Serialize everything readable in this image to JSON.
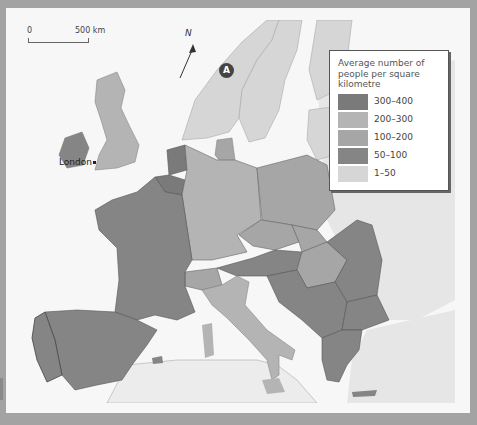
{
  "figure": {
    "type": "choropleth map",
    "region": "Western and Central Europe",
    "background": "#a3a3a3",
    "sea_color": "#f7f7f7",
    "non_data_land_color": "#e9e9e9"
  },
  "scale_bar": {
    "start_label": "0",
    "end_label": "500 km"
  },
  "north_arrow": {
    "label": "N"
  },
  "markers": [
    {
      "label": "A",
      "location": "Norway"
    }
  ],
  "cities": [
    {
      "name": "London"
    }
  ],
  "legend": {
    "title": "Average number of people per square kilometre",
    "classes": [
      {
        "label": "300–400",
        "color": "#7a7a7a"
      },
      {
        "label": "200–300",
        "color": "#b4b4b4"
      },
      {
        "label": "100–200",
        "color": "#a6a6a6"
      },
      {
        "label": "50–100",
        "color": "#858585"
      },
      {
        "label": "1–50",
        "color": "#d6d6d6"
      }
    ]
  },
  "countries": [
    {
      "name": "Netherlands",
      "class": "300–400"
    },
    {
      "name": "Belgium",
      "class": "300–400"
    },
    {
      "name": "United Kingdom",
      "class": "200–300"
    },
    {
      "name": "Germany",
      "class": "200–300"
    },
    {
      "name": "Italy",
      "class": "200–300"
    },
    {
      "name": "Luxembourg",
      "class": "100–200"
    },
    {
      "name": "Switzerland",
      "class": "100–200"
    },
    {
      "name": "Poland",
      "class": "100–200"
    },
    {
      "name": "Czech Republic",
      "class": "100–200"
    },
    {
      "name": "Hungary",
      "class": "100–200"
    },
    {
      "name": "Denmark",
      "class": "100–200"
    },
    {
      "name": "France",
      "class": "50–100"
    },
    {
      "name": "Spain",
      "class": "50–100"
    },
    {
      "name": "Portugal",
      "class": "50–100"
    },
    {
      "name": "Austria",
      "class": "50–100"
    },
    {
      "name": "Ireland",
      "class": "50–100"
    },
    {
      "name": "Slovakia",
      "class": "100–200"
    },
    {
      "name": "Romania",
      "class": "50–100"
    },
    {
      "name": "Former Yugoslavia",
      "class": "50–100"
    },
    {
      "name": "Bulgaria",
      "class": "50–100"
    },
    {
      "name": "Greece",
      "class": "50–100"
    },
    {
      "name": "Norway",
      "class": "1–50"
    },
    {
      "name": "Sweden",
      "class": "1–50"
    },
    {
      "name": "Finland",
      "class": "1–50"
    }
  ]
}
